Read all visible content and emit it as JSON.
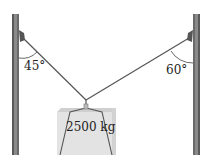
{
  "diagram": {
    "left_angle": "45°",
    "right_angle": "60°",
    "mass_label": "2500 kg",
    "colors": {
      "post": "#7a7a7a",
      "post_dark": "#4a4a4a",
      "cable": "#555555",
      "block_top": "#d8d8d8",
      "block_front": "#e6e6e6"
    }
  }
}
